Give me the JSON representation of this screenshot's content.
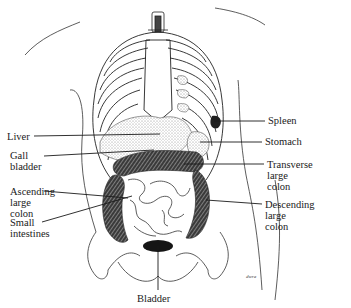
{
  "figure": {
    "labels": {
      "liver": "Liver",
      "gall_bladder": "Gall\nbladder",
      "ascending_colon": "Ascending\nlarge\ncolon",
      "small_intestines": "Small\nintestines",
      "spleen": "Spleen",
      "stomach": "Stomach",
      "transverse_colon": "Transverse\nlarge\ncolon",
      "descending_colon": "Descending\nlarge\ncolon",
      "bladder": "Bladder"
    },
    "signature": "dwra"
  },
  "colors": {
    "ink": "#1a1a1a",
    "stipple": "#b8b8b8",
    "dark_organ": "#2a2a2a",
    "background": "#ffffff"
  }
}
